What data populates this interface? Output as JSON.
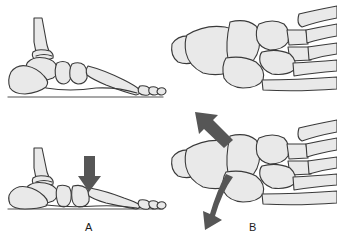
{
  "figure": {
    "width": 337,
    "height": 244,
    "background_color": "#ffffff"
  },
  "palette": {
    "bone_fill": "#e9e9e9",
    "bone_outline": "#3a3a3a",
    "arrow_color": "#565656",
    "ground_color": "#8a8a8a",
    "label_color": "#1c1c1c"
  },
  "panels": [
    {
      "id": "top-left",
      "label": "",
      "view": "lateral",
      "description": "Lateral view of foot skeleton with normal longitudinal arch resting on ground line",
      "bones": [
        "tibia",
        "fibula",
        "talus",
        "calcaneus",
        "navicular",
        "cuneiform",
        "metatarsal",
        "phalanges"
      ],
      "has_ground_line": true,
      "arrows": []
    },
    {
      "id": "bottom-left",
      "label": "A",
      "view": "lateral",
      "description": "Lateral view of foot skeleton with collapsed arch and downward force arrow at midfoot",
      "bones": [
        "tibia",
        "fibula",
        "talus",
        "calcaneus",
        "navicular",
        "cuneiform",
        "metatarsal",
        "phalanges"
      ],
      "has_ground_line": true,
      "arrows": [
        {
          "name": "downward-force-arrow",
          "type": "straight",
          "direction": "down"
        }
      ]
    },
    {
      "id": "top-right",
      "label": "",
      "view": "dorsal",
      "description": "Dorsal view of tarsal and metatarsal bones of the foot",
      "bones": [
        "calcaneus",
        "talus",
        "navicular",
        "cuboid",
        "cuneiforms",
        "metatarsals"
      ],
      "has_ground_line": false,
      "arrows": []
    },
    {
      "id": "bottom-right",
      "label": "B",
      "view": "dorsal",
      "description": "Dorsal view of foot with straight abduction arrow and curved rotation arrow",
      "bones": [
        "calcaneus",
        "talus",
        "navicular",
        "cuboid",
        "cuneiforms",
        "metatarsals"
      ],
      "has_ground_line": false,
      "arrows": [
        {
          "name": "abduction-arrow",
          "type": "straight",
          "direction": "up-left"
        },
        {
          "name": "rotation-arrow",
          "type": "curved",
          "direction": "counterclockwise"
        }
      ]
    }
  ],
  "labels": {
    "panel_a": "A",
    "panel_b": "B"
  }
}
